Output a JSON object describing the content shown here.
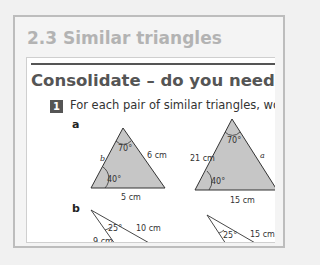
{
  "section": {
    "title": "2.3 Similar triangles"
  },
  "card": {
    "title": "Consolidate – do you need more?",
    "question": {
      "number": "1",
      "text": "For each pair of similar triangles, work out"
    },
    "parts": [
      {
        "label": "a",
        "triangles": [
          {
            "top_angle": "70°",
            "bottom_left_angle": "40°",
            "left_side": "b",
            "right_side": "6 cm",
            "base": "5 cm"
          },
          {
            "top_angle": "70°",
            "bottom_left_angle": "40°",
            "left_side": "21 cm",
            "right_side": "a",
            "base": "15 cm"
          }
        ]
      },
      {
        "label": "b",
        "triangles": [
          {
            "angle": "25°",
            "side_upper": "10 cm",
            "side_lower": "9 cm"
          },
          {
            "angle": "25°",
            "side_upper": "15 cm"
          }
        ]
      }
    ]
  }
}
